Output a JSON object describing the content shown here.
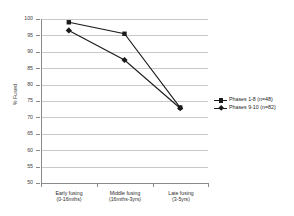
{
  "chart_data": {
    "type": "line",
    "title": "",
    "xlabel": "",
    "ylabel": "% Fused",
    "ylim": [
      50,
      100
    ],
    "yticks": [
      100,
      95,
      90,
      85,
      80,
      75,
      70,
      65,
      60,
      55,
      50
    ],
    "grid": true,
    "legend_position": "right",
    "categories": [
      "Early fusing (0-16mths)",
      "Middle fusing (16mths-3yrs)",
      "Late fusing (3-5yrs)"
    ],
    "category_lines": [
      {
        "line1": "Early fusing",
        "line2": "(0-16mths)"
      },
      {
        "line1": "Middle fusing",
        "line2": "(16mths-3yrs)"
      },
      {
        "line1": "Late fusing",
        "line2": "(3-5yrs)"
      }
    ],
    "series": [
      {
        "name": "Phases 1-8 (n=48)",
        "values": [
          99,
          95.5,
          73
        ],
        "color": "#1a1a1a",
        "marker": "square"
      },
      {
        "name": "Phases 9-10 (n=82)",
        "values": [
          96.5,
          87.5,
          72.8
        ],
        "color": "#1a1a1a",
        "marker": "diamond"
      }
    ]
  },
  "axes": {
    "y_title": "% Fused",
    "y_tick_labels": [
      "100",
      "95",
      "90",
      "85",
      "80",
      "75",
      "70",
      "65",
      "60",
      "55",
      "50"
    ]
  },
  "legend": {
    "entries": [
      {
        "label": "Phases 1-8 (n=48)"
      },
      {
        "label": "Phases 9-10 (n=82)"
      }
    ]
  }
}
